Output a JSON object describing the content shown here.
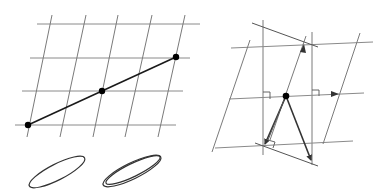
{
  "figure": {
    "panels": [
      {
        "id": "left",
        "description": "Skewed grid lattice with a straight line through three lattice points",
        "horizontal_lines": [
          {
            "x1": 37,
            "y1": 24,
            "x2": 200,
            "y2": 24
          },
          {
            "x1": 30,
            "y1": 58,
            "x2": 190,
            "y2": 58
          },
          {
            "x1": 22,
            "y1": 91,
            "x2": 183,
            "y2": 91
          },
          {
            "x1": 15,
            "y1": 125,
            "x2": 176,
            "y2": 125
          }
        ],
        "slanted_lines": [
          {
            "x1": 52,
            "y1": 15,
            "x2": 27,
            "y2": 137
          },
          {
            "x1": 86,
            "y1": 15,
            "x2": 60,
            "y2": 137
          },
          {
            "x1": 118,
            "y1": 15,
            "x2": 93,
            "y2": 137
          },
          {
            "x1": 152,
            "y1": 15,
            "x2": 125,
            "y2": 137
          },
          {
            "x1": 185,
            "y1": 15,
            "x2": 158,
            "y2": 137
          }
        ],
        "line_segment": {
          "x1": 28,
          "y1": 125,
          "x2": 176,
          "y2": 57
        },
        "points": [
          {
            "x": 28,
            "y": 125
          },
          {
            "x": 102,
            "y": 91
          },
          {
            "x": 176,
            "y": 57
          }
        ]
      },
      {
        "id": "ellipses",
        "description": "Single ellipse and a double (doubled outline) ellipse",
        "shapes": [
          {
            "type": "ellipse",
            "cx": 57,
            "cy": 172,
            "rx": 31,
            "ry": 8,
            "rotate": -27
          },
          {
            "type": "ellipse",
            "cx": 132,
            "cy": 171,
            "rx": 32,
            "ry": 8,
            "rotate": -26
          },
          {
            "type": "ellipse",
            "cx": 133,
            "cy": 170,
            "rx": 30,
            "ry": 6.5,
            "rotate": -26
          }
        ]
      },
      {
        "id": "right",
        "description": "Lattice projection construction with perpendiculars, right-angle marks and vectors",
        "vertical_lines": [
          {
            "x1": 263,
            "y1": 20,
            "x2": 263,
            "y2": 155
          },
          {
            "x1": 312,
            "y1": 32,
            "x2": 312,
            "y2": 165
          }
        ],
        "horizontal_lines": [
          {
            "x1": 231,
            "y1": 48,
            "x2": 373,
            "y2": 42
          },
          {
            "x1": 229,
            "y1": 99,
            "x2": 364,
            "y2": 93
          },
          {
            "x1": 215,
            "y1": 148,
            "x2": 353,
            "y2": 141
          }
        ],
        "slanted_lines": [
          {
            "x1": 212,
            "y1": 152,
            "x2": 250,
            "y2": 40
          },
          {
            "x1": 323,
            "y1": 144,
            "x2": 360,
            "y2": 33
          },
          {
            "x1": 270,
            "y1": 140,
            "x2": 306,
            "y2": 36
          }
        ],
        "diagonals": [
          {
            "x1": 252,
            "y1": 23,
            "x2": 318,
            "y2": 47
          },
          {
            "x1": 255,
            "y1": 143,
            "x2": 318,
            "y2": 166
          }
        ],
        "center_point": {
          "x": 286,
          "y": 96
        },
        "vectors": [
          {
            "x1": 286,
            "y1": 96,
            "x2": 265,
            "y2": 144
          },
          {
            "x1": 286,
            "y1": 96,
            "x2": 311,
            "y2": 160
          }
        ],
        "small_arrows": [
          {
            "x": 303,
            "y": 48,
            "direction": "up-right"
          },
          {
            "x": 336,
            "y": 94,
            "direction": "right"
          }
        ],
        "right_angle_marks": [
          {
            "x": 263,
            "y": 99
          },
          {
            "x": 312,
            "y": 97
          },
          {
            "x": 268,
            "y": 146
          }
        ]
      }
    ]
  }
}
